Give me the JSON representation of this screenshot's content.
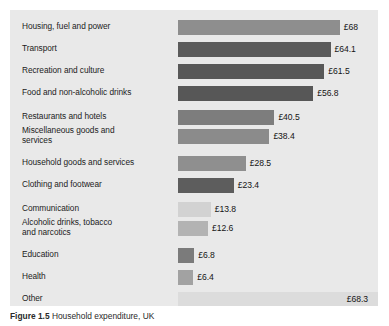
{
  "figure": {
    "caption_label": "Figure 1.5",
    "caption_text": "Household expenditure, UK",
    "panel_background": "#e9e9e9",
    "page_background": "#ffffff"
  },
  "chart_data": {
    "type": "bar",
    "orientation": "horizontal",
    "title": "",
    "subtitle": "",
    "xlabel": "",
    "ylabel": "",
    "xlim": [
      0,
      70
    ],
    "grid": false,
    "legend": "none",
    "value_prefix": "£",
    "categories": [
      "Housing, fuel and power",
      "Transport",
      "Recreation and culture",
      "Food and non-alcoholic drinks",
      "Restaurants and hotels",
      "Miscellaneous goods and\nservices",
      "Household goods and services",
      "Clothing and footwear",
      "Communication",
      "Alcoholic drinks, tobacco\nand narcotics",
      "Education",
      "Health",
      "Other"
    ],
    "values": [
      68,
      64.1,
      61.5,
      56.8,
      40.5,
      38.4,
      28.5,
      23.4,
      13.8,
      12.6,
      6.8,
      6.4,
      68.3
    ],
    "value_labels": [
      "£68",
      "£64.1",
      "£61.5",
      "£56.8",
      "£40.5",
      "£38.4",
      "£28.5",
      "£23.4",
      "£13.8",
      "£12.6",
      "£6.8",
      "£6.4",
      "£68.3"
    ],
    "bar_colors": [
      "#8e8e8e",
      "#5b5b5b",
      "#585858",
      "#575757",
      "#7d7d7d",
      "#8b8b8b",
      "#8f8f8f",
      "#5d5d5d",
      "#d2d2d2",
      "#b3b3b3",
      "#7b7b7b",
      "#a2a2a2",
      "#dcdcdc"
    ]
  }
}
